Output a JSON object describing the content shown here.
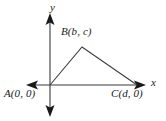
{
  "figure": {
    "type": "coordinate-plane-triangle-diagram",
    "background_color": "#ffffff",
    "stroke_color": "#3a3a3a",
    "text_color": "#1a1a1a",
    "axes": {
      "x_axis_label": "x",
      "y_axis_label": "y",
      "origin": {
        "x": 50,
        "y": 85
      },
      "x_axis_left_end": {
        "x": 26,
        "y": 85
      },
      "x_axis_right_end": {
        "x": 146,
        "y": 85
      },
      "y_axis_top_end": {
        "x": 50,
        "y": 13
      },
      "y_axis_bottom_end": {
        "x": 50,
        "y": 117
      },
      "arrowheads": [
        "left",
        "right",
        "up",
        "down"
      ]
    },
    "triangle": {
      "vertices": [
        {
          "name": "A",
          "label": "A(0, 0)",
          "x": 50,
          "y": 85
        },
        {
          "name": "B",
          "label": "B(b, c)",
          "x": 82,
          "y": 47
        },
        {
          "name": "C",
          "label": "C(d, 0)",
          "x": 137,
          "y": 85
        }
      ]
    }
  }
}
